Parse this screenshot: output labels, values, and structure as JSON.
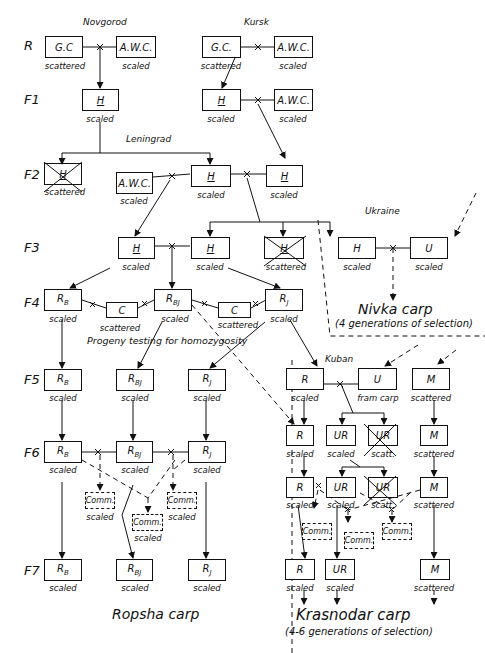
{
  "generations": [
    "R",
    "F1",
    "F2",
    "F3",
    "F4",
    "F5",
    "F6",
    "F7"
  ],
  "regions": {
    "novgorod": "Novgorod",
    "kursk": "Kursk",
    "leningrad": "Leningrad",
    "ukraine": "Ukraine",
    "kuban": "Kuban"
  },
  "annotations": {
    "progeny": "Progeny testing for homozygosity"
  },
  "outcomes": {
    "nivka_title": "Nivka carp",
    "nivka_sub": "(4 generations of selection)",
    "ropsha_title": "Ropsha carp",
    "krasnodar_title": "Krasnodar carp",
    "krasnodar_sub": "(4-6 generations of selection)"
  },
  "nodes": {
    "nov_gc": {
      "label": "G.C",
      "cap": "scattered"
    },
    "nov_awc": {
      "label": "A.W.C.",
      "cap": "scaled"
    },
    "kur_gc": {
      "label": "G.C.",
      "cap": "scattered"
    },
    "kur_awc": {
      "label": "A.W.C.",
      "cap": "scaled"
    },
    "f1_h1": {
      "label": "H",
      "cap": "scaled"
    },
    "f1_h2": {
      "label": "H",
      "cap": "scaled"
    },
    "f1_awc": {
      "label": "A.W.C.",
      "cap": "scaled"
    },
    "f2_h_x": {
      "label": "H",
      "cap": "scattered"
    },
    "f2_awc": {
      "label": "A.W.C.",
      "cap": "scaled"
    },
    "f2_h1": {
      "label": "H",
      "cap": "scaled"
    },
    "f2_h2": {
      "label": "H",
      "cap": "scaled"
    },
    "f3_h1": {
      "label": "H",
      "cap": "scaled"
    },
    "f3_h2": {
      "label": "H",
      "cap": "scaled"
    },
    "f3_h_x": {
      "label": "H",
      "cap": "scattered"
    },
    "ukr_h": {
      "label": "H",
      "cap": "scaled"
    },
    "ukr_u": {
      "label": "U",
      "cap": "scaled"
    },
    "f4_rb": {
      "label": "RB",
      "cap": "scaled"
    },
    "f4_c1": {
      "label": "C",
      "cap": "scattered"
    },
    "f4_rbj": {
      "label": "RBJ",
      "cap": "scaled"
    },
    "f4_c2": {
      "label": "C",
      "cap": "scattered"
    },
    "f4_rj": {
      "label": "RJ",
      "cap": "scaled"
    },
    "f5_rb": {
      "label": "RB",
      "cap": "scaled"
    },
    "f5_rbj": {
      "label": "RBJ",
      "cap": "scaled"
    },
    "f5_rj": {
      "label": "RJ",
      "cap": "scaled"
    },
    "kub_r": {
      "label": "R",
      "cap": "scaled"
    },
    "kub_u": {
      "label": "U",
      "cap": "fram carp"
    },
    "kub_m": {
      "label": "M",
      "cap": "scattered"
    },
    "f6_rb": {
      "label": "RB",
      "cap": "scaled"
    },
    "f6_rbj": {
      "label": "RBJ",
      "cap": "scaled"
    },
    "f6_rj": {
      "label": "RJ",
      "cap": "scaled"
    },
    "f6_comm1": {
      "label": "Comm.",
      "cap": "scaled"
    },
    "f6_comm2": {
      "label": "Comm.",
      "cap": "scaled"
    },
    "f6_comm3": {
      "label": "Comm.",
      "cap": "scaled"
    },
    "k1_r": {
      "label": "R",
      "cap": "scaled"
    },
    "k1_ur": {
      "label": "UR",
      "cap": "scaled"
    },
    "k1_ur_x": {
      "label": "UR",
      "cap": "scatt."
    },
    "k1_m": {
      "label": "M",
      "cap": "scattered"
    },
    "k2_r": {
      "label": "R",
      "cap": "scaled"
    },
    "k2_ur": {
      "label": "UR",
      "cap": "scaled"
    },
    "k2_ur_x": {
      "label": "UR",
      "cap": "scatt."
    },
    "k2_m": {
      "label": "M",
      "cap": "scattered"
    },
    "k_comm1": {
      "label": "Comm."
    },
    "k_comm2": {
      "label": "Comm."
    },
    "k_comm3": {
      "label": "Comm."
    },
    "f7_rb": {
      "label": "RB",
      "cap": "scaled"
    },
    "f7_rbj": {
      "label": "RBJ",
      "cap": "scaled"
    },
    "f7_rj": {
      "label": "RJ",
      "cap": "scaled"
    },
    "k3_r": {
      "label": "R",
      "cap": "scaled"
    },
    "k3_ur": {
      "label": "UR",
      "cap": "scaled"
    },
    "k3_m": {
      "label": "M",
      "cap": "scattered"
    }
  }
}
